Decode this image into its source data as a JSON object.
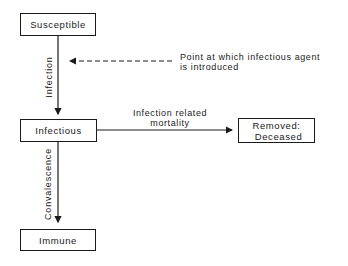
{
  "nodes": {
    "susceptible": "Susceptible",
    "infectious": "Infectious",
    "removed_line1": "Removed:",
    "removed_line2": "Deceased",
    "immune": "Immune"
  },
  "edges": {
    "infection": "Infection",
    "mortality_line1": "Infection related",
    "mortality_line2": "mortality",
    "convalescence": "Convalescence"
  },
  "annotation": {
    "line1": "Point at which infectious agent",
    "line2": "is introduced"
  }
}
